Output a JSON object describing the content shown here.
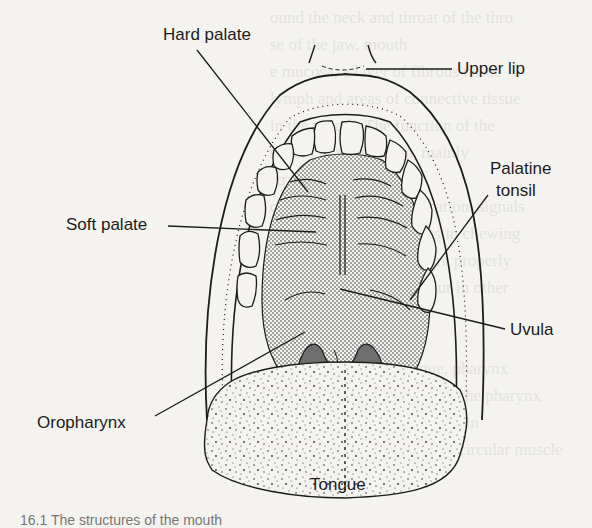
{
  "figure": {
    "labels": {
      "hard_palate": "Hard palate",
      "upper_lip": "Upper lip",
      "palatine_tonsil_line1": "Palatine",
      "palatine_tonsil_line2": "tonsil",
      "soft_palate": "Soft palate",
      "uvula": "Uvula",
      "oropharynx": "Oropharynx",
      "tongue": "Tongue"
    },
    "caption_fragment": "16.1  The structures of the mouth"
  },
  "colors": {
    "ink": "#1c1c1c",
    "paper": "#f4f3ef",
    "stipple": "#8a8a8a",
    "shadow": "#6e6e6e"
  }
}
